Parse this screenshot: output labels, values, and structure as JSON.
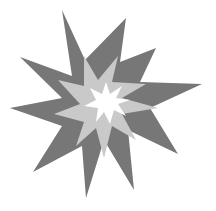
{
  "image": {
    "subject": "explosion-starburst",
    "background": "#ffffff",
    "layers": [
      {
        "name": "outer-burst",
        "color": "#777777"
      },
      {
        "name": "middle-burst",
        "color": "#c9c9c9"
      },
      {
        "name": "inner-burst",
        "color": "#ffffff"
      }
    ]
  }
}
